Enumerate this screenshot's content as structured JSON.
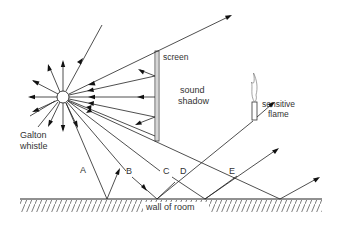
{
  "diagram": {
    "labels": {
      "screen": "screen",
      "sound_shadow_line1": "sound",
      "sound_shadow_line2": "shadow",
      "sensitive_flame_line1": "sensitive",
      "sensitive_flame_line2": "flame",
      "galton_whistle_line1": "Galton",
      "galton_whistle_line2": "whistle",
      "wall": "wall of room",
      "ray_A": "A",
      "ray_B": "B",
      "ray_C": "C",
      "ray_D": "D",
      "ray_E": "E"
    },
    "components": [
      {
        "name": "Galton whistle",
        "shape": "small circle source",
        "position": [
          63,
          97
        ]
      },
      {
        "name": "screen",
        "shape": "vertical double bar",
        "position": [
          157,
          50
        ]
      },
      {
        "name": "sensitive flame",
        "shape": "tube with flame",
        "position": [
          255,
          75
        ]
      },
      {
        "name": "wall of room",
        "shape": "hatched horizontal line",
        "y": 199
      }
    ],
    "colors": {
      "line": "#222222",
      "background": "#ffffff",
      "text": "#333333"
    }
  }
}
